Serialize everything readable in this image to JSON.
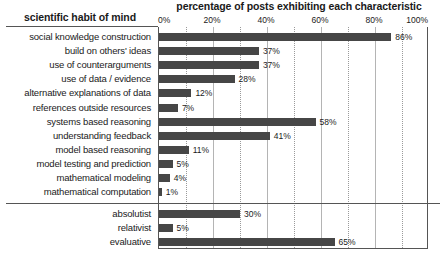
{
  "chart_data": {
    "type": "bar",
    "orientation": "horizontal",
    "title": "percentage of posts exhibiting each characteristic",
    "category_axis_title": "scientific habit of mind",
    "xlabel": "",
    "ylabel": "",
    "xlim": [
      0,
      100
    ],
    "grid": true,
    "gridlines_major": [
      0,
      20,
      40,
      60,
      80,
      100
    ],
    "gridlines_minor": [
      10,
      30,
      50,
      70,
      90
    ],
    "legend": null,
    "tick_labels": [
      "0%",
      "20%",
      "40%",
      "60%",
      "80%",
      "100%"
    ],
    "tick_values": [
      0,
      20,
      40,
      60,
      80,
      100
    ],
    "bar_color": "#464646",
    "categories": [
      "social knowledge construction",
      "build on others' ideas",
      "use of counterarguments",
      "use of data / evidence",
      "alternative explanations of data",
      "references outside resources",
      "systems based reasoning",
      "understanding feedback",
      "model based reasoning",
      "model testing and prediction",
      "mathematical modeling",
      "mathematical computation",
      "absolutist",
      "relativist",
      "evaluative"
    ],
    "values": [
      86,
      37,
      37,
      28,
      12,
      7,
      58,
      41,
      11,
      5,
      4,
      1,
      30,
      5,
      65
    ],
    "value_labels": [
      "86%",
      "37%",
      "37%",
      "28%",
      "12%",
      "7%",
      "58%",
      "41%",
      "11%",
      "5%",
      "4%",
      "1%",
      "30%",
      "5%",
      "65%"
    ],
    "groups": [
      {
        "name": "scientific habit of mind",
        "categories": [
          "social knowledge construction",
          "build on others' ideas",
          "use of counterarguments",
          "use of data / evidence",
          "alternative explanations of data",
          "references outside resources",
          "systems based reasoning",
          "understanding feedback",
          "model based reasoning",
          "model testing and prediction",
          "mathematical modeling",
          "mathematical computation"
        ],
        "values": [
          86,
          37,
          37,
          28,
          12,
          7,
          58,
          41,
          11,
          5,
          4,
          1
        ]
      },
      {
        "name": "",
        "categories": [
          "absolutist",
          "relativist",
          "evaluative"
        ],
        "values": [
          30,
          5,
          65
        ]
      }
    ]
  }
}
